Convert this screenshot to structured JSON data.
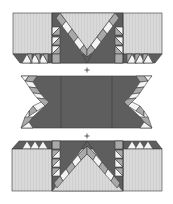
{
  "diagram": {
    "title": "",
    "sections": [
      {
        "name": "top-section"
      },
      {
        "name": "middle-section"
      },
      {
        "name": "bottom-section"
      }
    ],
    "join_symbols": [
      "+",
      "+"
    ],
    "colors": {
      "light": "#d9d9d9",
      "mid": "#a9a9a9",
      "dark": "#5e5e5e",
      "white": "#f4f4f4",
      "outline": "#3a3a3a"
    }
  }
}
